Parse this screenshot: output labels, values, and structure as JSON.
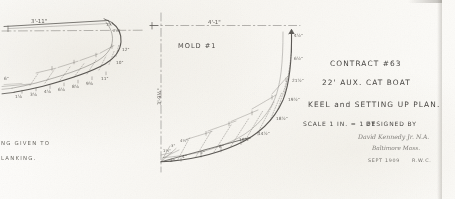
{
  "document": {
    "kind": "naval-architecture-drawing",
    "sheet_background": "#fbfaf7",
    "ink_color": "#2c2a27"
  },
  "title_block": {
    "contract": "CONTRACT #63",
    "vessel": "22' AUX. CAT BOAT",
    "drawing_title": "KEEL and SETTING UP PLAN.",
    "scale": "SCALE 1 IN. = 1 FT",
    "designed_by_label": "DESIGNED BY",
    "signature": "David Kennedy Jr. N.A.",
    "signature_location": "Baltimore  Mass.",
    "date": "SEPT 1909",
    "initials": "R.W.C."
  },
  "left_drawing": {
    "name": "stem-profile",
    "top_dimension": "3'-11\"",
    "corner_offsets": [
      "1½\"",
      "2¼\""
    ],
    "baseline_offsets": [
      "1⅛",
      "3⅛",
      "4⅛",
      "6⅛",
      "8⅛",
      "9⅜",
      "11\""
    ],
    "curve_offsets": [
      "7\"",
      "8\"",
      "10\"",
      "12\""
    ],
    "heel_note": "6\""
  },
  "right_drawing": {
    "name": "mold-1",
    "label": "MOLD #1",
    "top_dimension": "4'-1\"",
    "vertical_dimension": "3'-9½\"",
    "baseline_offsets": [
      "2\"",
      "4\"",
      "5\"",
      "8\"",
      "10½\""
    ],
    "curve_offsets": [
      "14½\"",
      "18½\"",
      "19½\"",
      "21½\"",
      "6½\"",
      "4½\""
    ],
    "heel_offsets": [
      "1½\"",
      "3\"",
      "4½\""
    ],
    "station_ticks": [
      "1'",
      "2'",
      "3'",
      "4'"
    ]
  },
  "edge_notes": {
    "line_1": "NG  GIVEN  TO",
    "line_2": "LANKING."
  }
}
